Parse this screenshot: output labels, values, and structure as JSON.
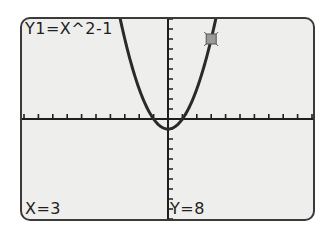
{
  "screen": {
    "equation_label": "Y1=X^2-1",
    "trace_x_label": "X=3",
    "trace_y_label": "Y=8"
  },
  "colors": {
    "screen_bg": "#eeeeec",
    "ink": "#1e1e1e",
    "cursor_fill": "#9a9a9a"
  },
  "chart_data": {
    "type": "line",
    "title": "Y1=X^2-1",
    "function": "y = x^2 - 1",
    "xlabel": "",
    "ylabel": "",
    "xlim": [
      -10,
      10
    ],
    "ylim": [
      -10,
      10
    ],
    "xscl": 1,
    "yscl": 1,
    "grid": false,
    "series": [
      {
        "name": "Y1",
        "x": [
          -3.3,
          -3,
          -2,
          -1,
          0,
          1,
          2,
          3,
          3.3
        ],
        "y": [
          9.89,
          8,
          3,
          0,
          -1,
          0,
          3,
          8,
          9.89
        ]
      }
    ],
    "trace_point": {
      "x": 3,
      "y": 8
    },
    "annotations": [
      "X=3",
      "Y=8"
    ]
  }
}
